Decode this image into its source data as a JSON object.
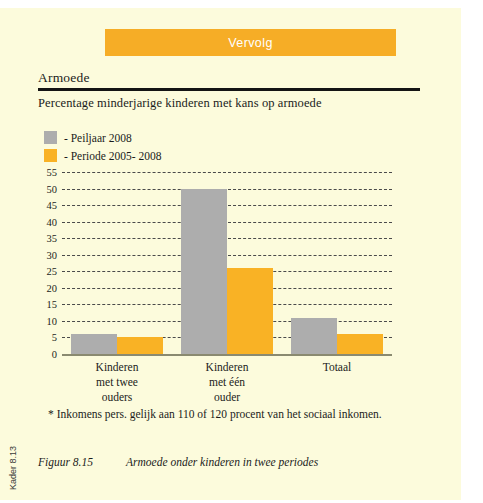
{
  "banner": {
    "label": "Vervolg",
    "color": "#f6ad26"
  },
  "heading": {
    "section_title": "Armoede",
    "subtitle": "Percentage minderjarige kinderen met kans op armoede"
  },
  "legend": {
    "items": [
      {
        "label": "- Peiljaar 2008",
        "color": "#adadad"
      },
      {
        "label": "- Periode 2005- 2008",
        "color": "#f9b225"
      }
    ]
  },
  "footnote": "* Inkomens pers. gelijk aan 110 of 120 procent van het sociaal inkomen.",
  "caption": {
    "number": "Figuur 8.15",
    "text": "Armoede onder kinderen in twee periodes"
  },
  "side_label": "Kader 8.13",
  "chart_data": {
    "type": "bar",
    "title": "Percentage minderjarige kinderen met kans op armoede",
    "xlabel": "",
    "ylabel": "",
    "ylim": [
      0,
      55
    ],
    "ytick_step": 5,
    "yticks": [
      "0",
      "5",
      "10",
      "15",
      "20",
      "25",
      "30",
      "35",
      "40",
      "45",
      "50",
      "55"
    ],
    "grid": true,
    "legend_position": "top-left",
    "categories": [
      "Kinderen met twee ouders",
      "Kinderen met één ouder",
      "Totaal"
    ],
    "category_lines": [
      [
        "Kinderen",
        "met twee",
        "ouders"
      ],
      [
        "Kinderen",
        "met één",
        "ouder"
      ],
      [
        "Totaal"
      ]
    ],
    "series": [
      {
        "name": "- Peiljaar 2008",
        "color": "#adadad",
        "values": [
          6,
          50,
          11
        ]
      },
      {
        "name": "- Periode 2005- 2008",
        "color": "#f9b225",
        "values": [
          5,
          26,
          6
        ]
      }
    ]
  }
}
